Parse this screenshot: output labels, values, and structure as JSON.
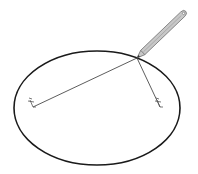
{
  "diagram": {
    "canvas": {
      "width": 198,
      "height": 174,
      "background": "#ffffff"
    },
    "ellipse": {
      "cx": 97,
      "cy": 108,
      "rx": 83,
      "ry": 57,
      "stroke": "#1a1a1a",
      "stroke_width": 1.6
    },
    "foci": [
      {
        "id": "focus-left",
        "x": 33,
        "y": 107
      },
      {
        "id": "focus-right",
        "x": 160,
        "y": 107
      }
    ],
    "string_point": {
      "x": 137,
      "y": 58
    },
    "string_color": "#333333",
    "pencil": {
      "tip": {
        "x": 137,
        "y": 58
      },
      "end": {
        "x": 185,
        "y": 12
      },
      "body_color": "#c8c8c8",
      "outline_color": "#666666"
    }
  }
}
